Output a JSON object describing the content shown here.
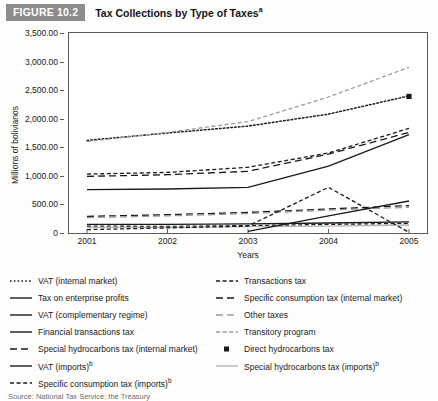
{
  "header": {
    "badge": "FIGURE 10.2",
    "title": "Tax Collections by Type of Taxes",
    "title_superscript": "a"
  },
  "source_note": "Source: National Tax Service; the Treasury",
  "colors": {
    "badge_background": "#8c8c8c",
    "badge_text": "#ffffff",
    "axis": "#5b5b5b",
    "series_dark": "#1a1a1a",
    "series_gray": "#9a9a9a",
    "background": "#ffffff"
  },
  "legend": {
    "left_column": [
      {
        "label": "VAT (internal market)",
        "style": "dotted",
        "color": "#1a1a1a",
        "sup": ""
      },
      {
        "label": "Tax on enterprise profits",
        "style": "solid",
        "color": "#1a1a1a",
        "sup": ""
      },
      {
        "label": "VAT (complementary regime)",
        "style": "solid",
        "color": "#1a1a1a",
        "sup": ""
      },
      {
        "label": "Financial transactions tax",
        "style": "solid",
        "color": "#1a1a1a",
        "sup": ""
      },
      {
        "label": "Special hydrocarbons tax (internal market)",
        "style": "dashed-long",
        "color": "#1a1a1a",
        "sup": ""
      },
      {
        "label": "VAT (imports)",
        "style": "solid",
        "color": "#1a1a1a",
        "sup": "b"
      },
      {
        "label": "Specific consumption tax (imports)",
        "style": "dashed-short",
        "color": "#1a1a1a",
        "sup": "b"
      }
    ],
    "right_column": [
      {
        "label": "Transactions tax",
        "style": "dashed-short",
        "color": "#1a1a1a",
        "sup": ""
      },
      {
        "label": "Specific consumption tax (internal market)",
        "style": "dashed-long",
        "color": "#1a1a1a",
        "sup": ""
      },
      {
        "label": "Other taxes",
        "style": "dashed-long",
        "color": "#9a9a9a",
        "sup": ""
      },
      {
        "label": "Transitory program",
        "style": "dashed-short",
        "color": "#9a9a9a",
        "sup": ""
      },
      {
        "label": "Direct hydrocarbons tax",
        "style": "marker-square",
        "color": "#1a1a1a",
        "sup": ""
      },
      {
        "label": "Special hydrocarbons tax (imports)",
        "style": "solid",
        "color": "#b4b4b4",
        "sup": "b"
      }
    ]
  },
  "chart_data": {
    "type": "line",
    "title": "Tax Collections by Type of Taxes",
    "xlabel": "Years",
    "ylabel": "Millions of bolivianos",
    "categories": [
      "2001",
      "2002",
      "2003",
      "2004",
      "2005"
    ],
    "x": [
      2001,
      2002,
      2003,
      2004,
      2005
    ],
    "ylim": [
      0,
      3500
    ],
    "yticks": [
      0,
      500,
      1000,
      1500,
      2000,
      2500,
      3000,
      3500
    ],
    "ytick_labels": [
      "0",
      "500.00",
      "1,000.00",
      "1,500.00",
      "2,000.00",
      "2,500.00",
      "3,000.00",
      "3,500.00"
    ],
    "grid": false,
    "legend_position": "below",
    "series": [
      {
        "name": "VAT (internal market)",
        "style": "dotted",
        "color": "#1a1a1a",
        "values": [
          1620,
          1750,
          1870,
          2080,
          2400
        ]
      },
      {
        "name": "Transitory program",
        "style": "dashed-short",
        "color": "#9a9a9a",
        "values": [
          1600,
          1760,
          1950,
          2380,
          2900
        ]
      },
      {
        "name": "Transactions tax",
        "style": "dashed-short",
        "color": "#1a1a1a",
        "values": [
          1030,
          1060,
          1150,
          1400,
          1830
        ]
      },
      {
        "name": "Special hydrocarbons tax (internal market)",
        "style": "dashed-long",
        "color": "#1a1a1a",
        "values": [
          990,
          1020,
          1080,
          1380,
          1760
        ]
      },
      {
        "name": "Tax on enterprise profits",
        "style": "solid",
        "color": "#1a1a1a",
        "values": [
          760,
          770,
          800,
          1170,
          1720
        ]
      },
      {
        "name": "Specific consumption tax (internal market)",
        "style": "dashed-long",
        "color": "#1a1a1a",
        "values": [
          290,
          320,
          360,
          420,
          480
        ]
      },
      {
        "name": "Other taxes",
        "style": "dashed-long",
        "color": "#9a9a9a",
        "values": [
          270,
          300,
          340,
          400,
          450
        ]
      },
      {
        "name": "VAT (imports)",
        "style": "solid",
        "color": "#1a1a1a",
        "values": [
          150,
          150,
          160,
          175,
          195
        ]
      },
      {
        "name": "Specific consumption tax (imports)",
        "style": "dashed-short",
        "color": "#1a1a1a",
        "values": [
          120,
          115,
          130,
          150,
          170
        ]
      },
      {
        "name": "Special hydrocarbons tax (imports)",
        "style": "solid",
        "color": "#b4b4b4",
        "values": [
          100,
          100,
          110,
          120,
          140
        ]
      },
      {
        "name": "Financial transactions tax",
        "style": "solid",
        "color": "#1a1a1a",
        "values": [
          null,
          null,
          30,
          300,
          560
        ]
      },
      {
        "name": "VAT (complementary regime)",
        "style": "dashed-short",
        "color": "#1a1a1a",
        "values": [
          60,
          90,
          120,
          800,
          10
        ]
      },
      {
        "name": "Direct hydrocarbons tax",
        "style": "marker-square",
        "color": "#1a1a1a",
        "values": [
          null,
          null,
          null,
          null,
          2390
        ]
      }
    ]
  }
}
